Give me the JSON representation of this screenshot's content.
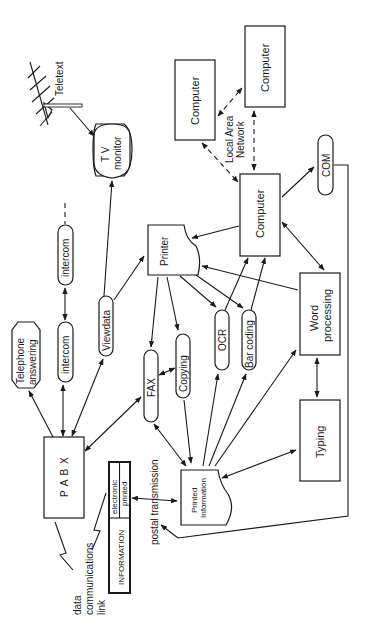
{
  "diagram": {
    "nodes": {
      "teletext": "Teletext",
      "tv_monitor_line1": "T V",
      "tv_monitor_line2": "monitor",
      "computer_a": "Computer",
      "computer_b": "Computer",
      "lan_line1": "Local Area",
      "lan_line2": "Network",
      "computer_main": "Computer",
      "com": "COM",
      "intercom_upper": "intercom",
      "intercom_lower": "intercom",
      "telephone_line1": "Telephone",
      "telephone_line2": "answering",
      "viewdata": "Viewdata",
      "printer": "Printer",
      "fax": "FAX",
      "copying": "Copying",
      "ocr": "OCR",
      "bar_coding": "Bar coding",
      "word_line1": "Word",
      "word_line2": "processing",
      "typing": "Typing",
      "pabx": "P A B X",
      "information": "INFORMATION",
      "electronic": "electronic",
      "printed": "printed",
      "printed_info_line1": "Printed",
      "printed_info_line2": "Information",
      "postal_transmission": "postal transmission",
      "data_link_line1": "data",
      "data_link_line2": "communications",
      "data_link_line3": "link"
    },
    "edges": [
      {
        "from": "Teletext antenna",
        "to": "TV monitor",
        "style": "arrow"
      },
      {
        "from": "Viewdata",
        "to": "TV monitor",
        "style": "arrow"
      },
      {
        "from": "Computer",
        "to": "Computer (LAN)",
        "style": "dashed-double-arrow"
      },
      {
        "from": "Computer (main)",
        "to": "Computer",
        "style": "dashed-double-arrow"
      },
      {
        "from": "Computer (main)",
        "to": "Computer (top)",
        "style": "dashed-double-arrow"
      },
      {
        "from": "Computer (main)",
        "to": "COM",
        "style": "arrow"
      },
      {
        "from": "Computer (main)",
        "to": "Printer",
        "style": "arrow"
      },
      {
        "from": "Computer (main)",
        "to": "Word processing",
        "style": "double-arrow"
      },
      {
        "from": "OCR",
        "to": "Computer (main)",
        "style": "arrow"
      },
      {
        "from": "Bar coding",
        "to": "Computer (main)",
        "style": "arrow"
      },
      {
        "from": "Word processing",
        "to": "Printer",
        "style": "arrow"
      },
      {
        "from": "Printer",
        "to": "FAX",
        "style": "arrow"
      },
      {
        "from": "Printer",
        "to": "Copying",
        "style": "arrow"
      },
      {
        "from": "Printer",
        "to": "OCR",
        "style": "arrow"
      },
      {
        "from": "Printer",
        "to": "Bar coding",
        "style": "arrow"
      },
      {
        "from": "Viewdata",
        "to": "Printer",
        "style": "arrow"
      },
      {
        "from": "FAX",
        "to": "Copying",
        "style": "double-arrow"
      },
      {
        "from": "PABX",
        "to": "Telephone answering",
        "style": "arrow"
      },
      {
        "from": "PABX",
        "to": "intercom",
        "style": "double-arrow"
      },
      {
        "from": "intercom",
        "to": "intercom",
        "style": "double-arrow"
      },
      {
        "from": "PABX",
        "to": "Viewdata",
        "style": "double-arrow"
      },
      {
        "from": "FAX",
        "to": "PABX",
        "style": "double-arrow"
      },
      {
        "from": "FAX",
        "to": "Printed Information",
        "style": "double-arrow"
      },
      {
        "from": "Copying",
        "to": "Printed Information",
        "style": "arrow"
      },
      {
        "from": "Printed Information",
        "to": "OCR",
        "style": "arrow"
      },
      {
        "from": "Printed Information",
        "to": "Bar coding",
        "style": "arrow"
      },
      {
        "from": "Printed Information",
        "to": "Word processing",
        "style": "arrow"
      },
      {
        "from": "Typing",
        "to": "Printed Information",
        "style": "double-arrow"
      },
      {
        "from": "Word processing",
        "to": "Typing",
        "style": "double-arrow"
      },
      {
        "from": "INFORMATION",
        "to": "Printed Information",
        "style": "double-arrow"
      },
      {
        "from": "COM",
        "to": "postal transmission",
        "style": "arrow"
      }
    ]
  }
}
